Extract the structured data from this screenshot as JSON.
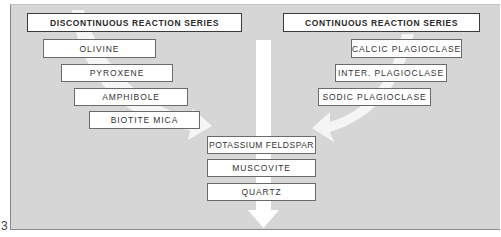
{
  "diagram": {
    "figure_number": "3",
    "discontinuous": {
      "header": "DISCONTINUOUS REACTION SERIES",
      "minerals": [
        "OLIVINE",
        "PYROXENE",
        "AMPHIBOLE",
        "BIOTITE MICA"
      ]
    },
    "continuous": {
      "header": "CONTINUOUS REACTION SERIES",
      "minerals": [
        "CALCIC PLAGIOCLASE",
        "INTER. PLAGIOCLASE",
        "SODIC  PLAGIOCLASE"
      ]
    },
    "merged": {
      "minerals": [
        "POTASSIUM FELDSPAR",
        "MUSCOVITE",
        "QUARTZ"
      ]
    },
    "colors": {
      "background": "#d6d6d6",
      "box": "#ffffff",
      "arrow": "#ffffff",
      "border": "#6a6a6a",
      "text": "#333333"
    }
  }
}
